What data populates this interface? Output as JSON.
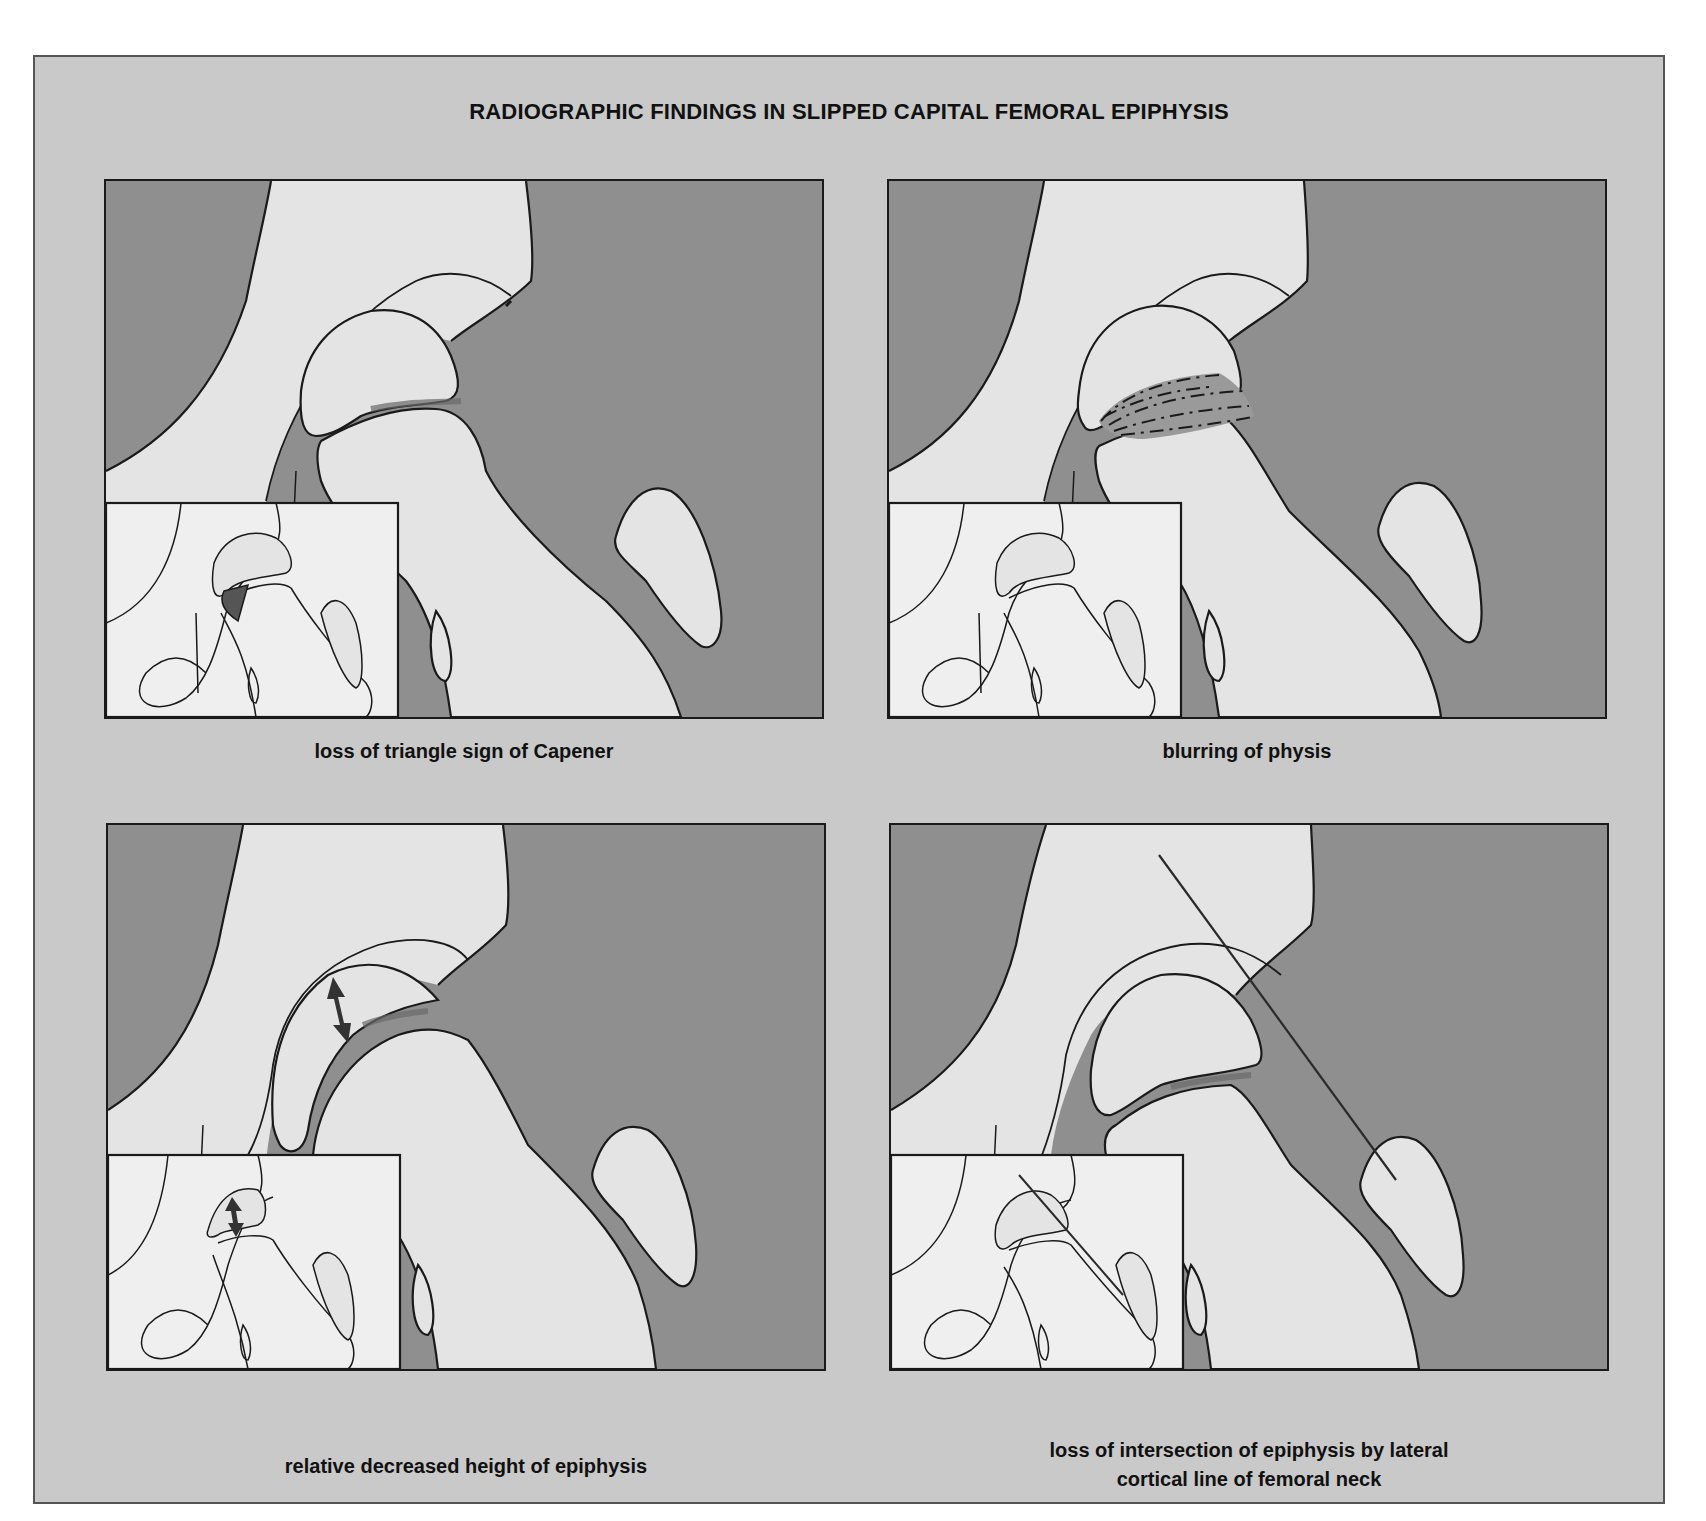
{
  "figure": {
    "title": "RADIOGRAPHIC FINDINGS IN SLIPPED CAPITAL FEMORAL EPIPHYSIS",
    "colors": {
      "frame_background": "#c9c9c9",
      "soft_tissue_dark": "#8f8f8f",
      "bone_light": "#e4e4e4",
      "inset_background": "#efefef",
      "line": "#1a1a1a",
      "highlight_dark": "#555555"
    },
    "panels": [
      {
        "id": "top-left",
        "caption": "loss of triangle sign of Capener",
        "features": [
          "hip-joint-drawing",
          "inset-normal-comparison",
          "dark-triangle-in-inset"
        ]
      },
      {
        "id": "top-right",
        "caption": "blurring of physis",
        "features": [
          "hip-joint-drawing",
          "hatched-blurred-physis",
          "inset-normal-comparison"
        ]
      },
      {
        "id": "bottom-left",
        "caption": "relative decreased height of epiphysis",
        "features": [
          "hip-joint-drawing",
          "double-headed-height-arrow",
          "inset-with-height-arrow"
        ]
      },
      {
        "id": "bottom-right",
        "caption_line1": "loss of intersection of epiphysis by lateral",
        "caption_line2": "cortical line of femoral neck",
        "features": [
          "hip-joint-drawing",
          "klein-line",
          "inset-with-klein-line"
        ]
      }
    ]
  }
}
